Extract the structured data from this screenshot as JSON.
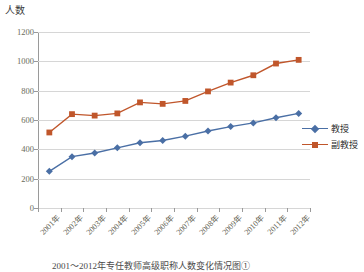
{
  "chart_data": {
    "type": "line",
    "title": "",
    "ylabel": "人数",
    "xlabel": "",
    "ylim": [
      0,
      1200
    ],
    "yticks": [
      0,
      200,
      400,
      600,
      800,
      1000,
      1200
    ],
    "grid": true,
    "legend_position": "right",
    "categories": [
      "2001年",
      "2002年",
      "2003年",
      "2004年",
      "2005年",
      "2006年",
      "2007年",
      "2008年",
      "2009年",
      "2010年",
      "2011年",
      "2012年"
    ],
    "series": [
      {
        "name": "教授",
        "color": "#4A6FA5",
        "marker": "diamond",
        "values": [
          250,
          350,
          375,
          410,
          445,
          460,
          490,
          525,
          555,
          580,
          615,
          645
        ]
      },
      {
        "name": "副教授",
        "color": "#C0562B",
        "marker": "square",
        "values": [
          515,
          640,
          630,
          645,
          720,
          710,
          730,
          795,
          855,
          905,
          985,
          1010
        ]
      }
    ]
  },
  "legend": {
    "items": [
      {
        "label": "教授"
      },
      {
        "label": "副教授"
      }
    ]
  },
  "caption": {
    "text": "2001～2012年专任教师高级职称人数变化情况图①"
  },
  "colors": {
    "series_professor": "#4A6FA5",
    "series_associate_professor": "#C0562B",
    "gridline": "#d6d6d6",
    "axis": "#9a9a9a"
  }
}
